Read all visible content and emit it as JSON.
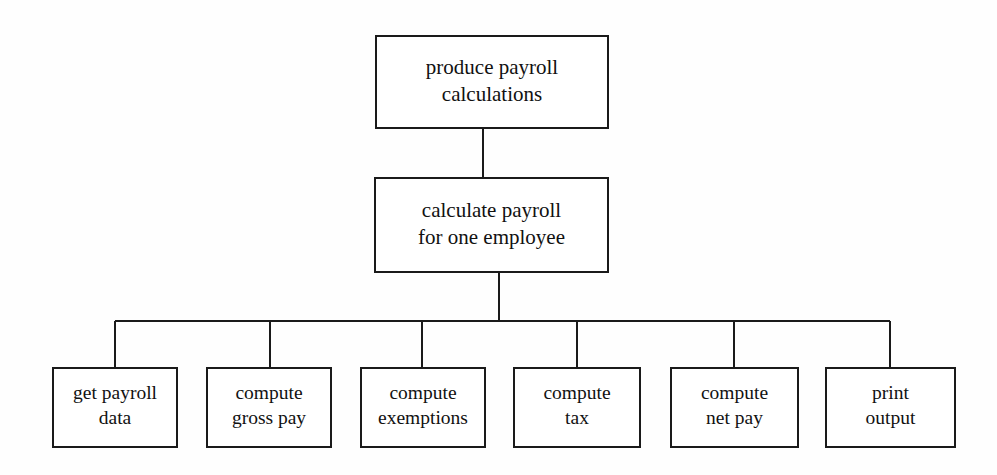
{
  "diagram": {
    "type": "structure-chart",
    "background_color": "#fefefe",
    "line_color": "#1a1a1a",
    "box_fill": "#ffffff",
    "nodes": [
      {
        "id": "produce-payroll-calculations",
        "level": 0,
        "lines": [
          "produce payroll",
          "calculations"
        ],
        "x": 376,
        "y": 36,
        "w": 232,
        "h": 92
      },
      {
        "id": "calculate-payroll-for-one-employee",
        "level": 1,
        "lines": [
          "calculate payroll",
          "for one employee"
        ],
        "x": 375,
        "y": 178,
        "w": 233,
        "h": 94
      },
      {
        "id": "get-payroll-data",
        "level": 2,
        "lines": [
          "get payroll",
          "data"
        ],
        "x": 53,
        "y": 368,
        "w": 124,
        "h": 79
      },
      {
        "id": "compute-gross-pay",
        "level": 2,
        "lines": [
          "compute",
          "gross pay"
        ],
        "x": 207,
        "y": 368,
        "w": 124,
        "h": 79
      },
      {
        "id": "compute-exemptions",
        "level": 2,
        "lines": [
          "compute",
          "exemptions"
        ],
        "x": 361,
        "y": 368,
        "w": 124,
        "h": 79
      },
      {
        "id": "compute-tax",
        "level": 2,
        "lines": [
          "compute",
          "tax"
        ],
        "x": 514,
        "y": 368,
        "w": 126,
        "h": 79
      },
      {
        "id": "compute-net-pay",
        "level": 2,
        "lines": [
          "compute",
          "net pay"
        ],
        "x": 671,
        "y": 368,
        "w": 127,
        "h": 79
      },
      {
        "id": "print-output",
        "level": 2,
        "lines": [
          "print",
          "output"
        ],
        "x": 826,
        "y": 368,
        "w": 129,
        "h": 79
      }
    ],
    "connectors": {
      "root_to_child_stem": {
        "x": 483,
        "y1": 128,
        "y2": 178
      },
      "child_to_bus_stem": {
        "x": 499,
        "y1": 272,
        "y2": 321
      },
      "bus": {
        "y": 321,
        "x1": 115,
        "x2": 890
      },
      "drops": [
        {
          "x": 115,
          "y1": 321,
          "y2": 368
        },
        {
          "x": 270,
          "y1": 321,
          "y2": 368
        },
        {
          "x": 422,
          "y1": 321,
          "y2": 368
        },
        {
          "x": 577,
          "y1": 321,
          "y2": 368
        },
        {
          "x": 734,
          "y1": 321,
          "y2": 368
        },
        {
          "x": 890,
          "y1": 321,
          "y2": 368
        }
      ]
    }
  }
}
